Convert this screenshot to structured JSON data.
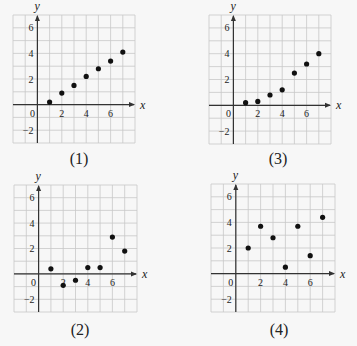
{
  "figure": {
    "background": "#f7f7f7",
    "grid_color": "#c8c8c8",
    "axis_color": "#333333",
    "point_color": "#111111",
    "text_color": "#222222"
  },
  "chart_data": [
    {
      "type": "scatter",
      "caption": "(1)",
      "xlabel": "x",
      "ylabel": "y",
      "xlim": [
        -2,
        8
      ],
      "ylim": [
        -3,
        7
      ],
      "grid": true,
      "xticks": [
        0,
        2,
        4,
        6
      ],
      "xtick_labels": [
        "0",
        "2",
        "4",
        "6"
      ],
      "yticks": [
        6,
        4,
        2,
        -2
      ],
      "ytick_labels": [
        "6",
        "4",
        "2",
        "−2"
      ],
      "points": [
        [
          1,
          0.2
        ],
        [
          2,
          0.9
        ],
        [
          3,
          1.5
        ],
        [
          4,
          2.2
        ],
        [
          5,
          2.8
        ],
        [
          6,
          3.4
        ],
        [
          7,
          4.1
        ]
      ],
      "layout": {
        "left": 13,
        "top": 15,
        "right": 135,
        "bottom": 143,
        "caption_x": 79,
        "caption_y": 164
      }
    },
    {
      "type": "scatter",
      "caption": "(3)",
      "xlabel": "x",
      "ylabel": "y",
      "xlim": [
        -2,
        8
      ],
      "ylim": [
        -3,
        7
      ],
      "grid": true,
      "xticks": [
        0,
        2,
        4,
        6
      ],
      "xtick_labels": [
        "0",
        "2",
        "4",
        "6"
      ],
      "yticks": [
        6,
        4,
        2,
        -2
      ],
      "ytick_labels": [
        "6",
        "4",
        "2",
        "−2"
      ],
      "points": [
        [
          1,
          0.2
        ],
        [
          2,
          0.3
        ],
        [
          3,
          0.8
        ],
        [
          4,
          1.2
        ],
        [
          5,
          2.5
        ],
        [
          6,
          3.2
        ],
        [
          7,
          4.0
        ]
      ],
      "layout": {
        "left": 209,
        "top": 15,
        "right": 331,
        "bottom": 144,
        "caption_x": 278,
        "caption_y": 164
      }
    },
    {
      "type": "scatter",
      "caption": "(2)",
      "xlabel": "x",
      "ylabel": "y",
      "xlim": [
        -2,
        8
      ],
      "ylim": [
        -3,
        7
      ],
      "grid": true,
      "xticks": [
        0,
        2,
        4,
        6
      ],
      "xtick_labels": [
        "0",
        "2",
        "4",
        "6"
      ],
      "yticks": [
        6,
        4,
        2,
        -2
      ],
      "ytick_labels": [
        "6",
        "4",
        "2",
        "−2"
      ],
      "points": [
        [
          1,
          0.4
        ],
        [
          2,
          -0.9
        ],
        [
          3,
          -0.5
        ],
        [
          4,
          0.5
        ],
        [
          5,
          0.5
        ],
        [
          6,
          2.9
        ],
        [
          7,
          1.8
        ]
      ],
      "layout": {
        "left": 14,
        "top": 185,
        "right": 137,
        "bottom": 312,
        "caption_x": 80,
        "caption_y": 335
      }
    },
    {
      "type": "scatter",
      "caption": "(4)",
      "xlabel": "x",
      "ylabel": "y",
      "xlim": [
        -2,
        8
      ],
      "ylim": [
        -3,
        7
      ],
      "grid": true,
      "xticks": [
        0,
        2,
        4,
        6
      ],
      "xtick_labels": [
        "0",
        "2",
        "4",
        "6"
      ],
      "yticks": [
        6,
        4,
        2,
        -2
      ],
      "ytick_labels": [
        "6",
        "4",
        "2",
        "−2"
      ],
      "points": [
        [
          1,
          2.0
        ],
        [
          2,
          3.7
        ],
        [
          3,
          2.8
        ],
        [
          4,
          0.5
        ],
        [
          5,
          3.7
        ],
        [
          6,
          1.4
        ],
        [
          7,
          4.4
        ]
      ],
      "layout": {
        "left": 211,
        "top": 184,
        "right": 335,
        "bottom": 312,
        "caption_x": 279,
        "caption_y": 335
      }
    }
  ]
}
